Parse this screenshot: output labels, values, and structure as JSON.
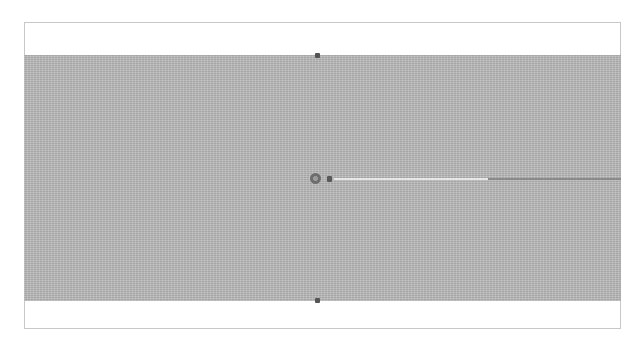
{
  "diagram": {
    "frame": {
      "border_color": "#c8c8c8",
      "background": "#ffffff"
    },
    "band": {
      "fill_color": "#b9b9b9",
      "texture": "noise"
    },
    "markers": [
      {
        "id": "top-marker",
        "shape": "square",
        "color": "#555555"
      },
      {
        "id": "bottom-marker",
        "shape": "square",
        "color": "#555555"
      }
    ],
    "source": {
      "ring_color": "#6e6e6e",
      "dot_color": "#5a5a5a"
    },
    "beam": {
      "segments": [
        {
          "id": "beam-light",
          "color": "#e6e6e6"
        },
        {
          "id": "beam-dark",
          "color": "#8a8a8a"
        }
      ]
    }
  }
}
